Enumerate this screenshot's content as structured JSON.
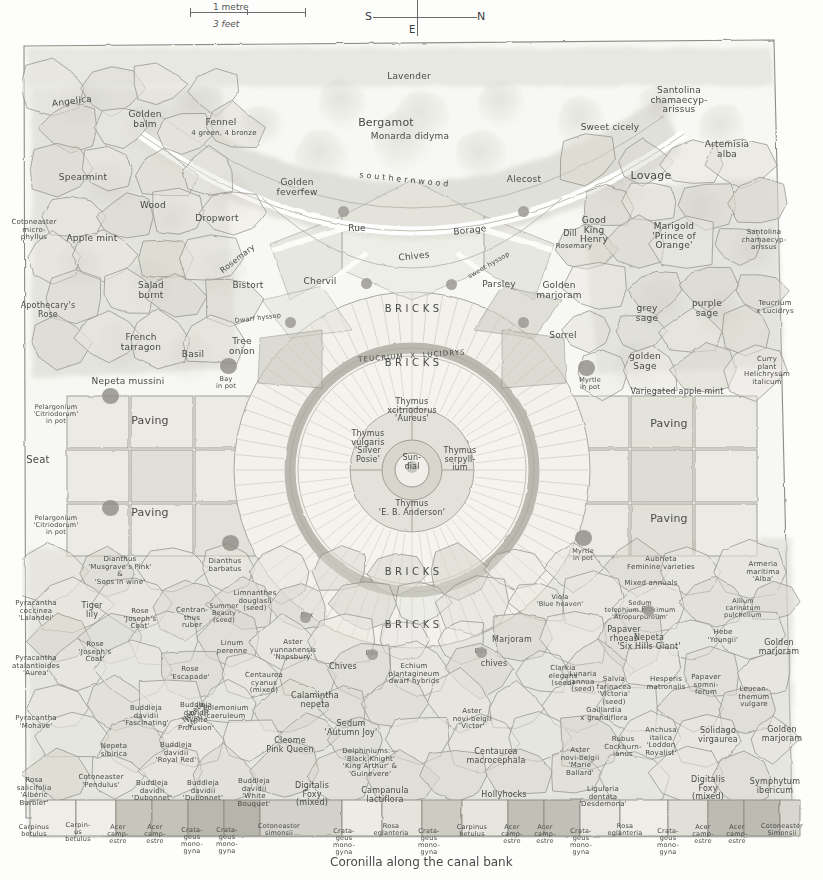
{
  "topbar": {
    "scale_upper": "1 metre",
    "scale_lower": "3 feet",
    "compass_s": "S",
    "compass_n": "N",
    "compass_e": "E"
  },
  "caption": "Coronilla along the canal bank",
  "brick_labels": {
    "top": "B R I C K S",
    "upper_mid": "B R I C K S",
    "lower_mid": "B R I C K S",
    "bottom": "B R I C K S",
    "teucrium_ring": "TEUCRIUM  X  LUCIDRYS"
  },
  "centre": {
    "sundial": "Sun-\ndial",
    "north_bed": "Thymus\nxcitriodorus\n'Aureus'",
    "west_bed": "Thymus\nvulgaris\n'Silver\nPosie'",
    "east_bed": "Thymus\nserpyll-\nium",
    "south_bed": "Thymus\n'E. B. Anderson'"
  },
  "paving": {
    "west_upper": "Paving",
    "west_lower": "Paving",
    "east_upper": "Paving",
    "east_lower": "Paving",
    "seat": "Seat"
  },
  "herb_beds": [
    {
      "name": "Lavender",
      "x": 409,
      "y": 72,
      "w": 120,
      "rot": 0
    },
    {
      "name": "Angelica",
      "x": 72,
      "y": 97,
      "w": 70,
      "rot": -7
    },
    {
      "name": "Golden\nbalm",
      "x": 145,
      "y": 110,
      "w": 58,
      "rot": 0
    },
    {
      "name": "Fennel",
      "x": 221,
      "y": 118,
      "w": 60,
      "rot": 0
    },
    {
      "name": "4 green, 4 bronze",
      "x": 224,
      "y": 130,
      "w": 90,
      "rot": 0,
      "size": "s7"
    },
    {
      "name": "Bergamot",
      "x": 386,
      "y": 117,
      "w": 80,
      "rot": 0,
      "size": "s11"
    },
    {
      "name": "Monarda didyma",
      "x": 410,
      "y": 132,
      "w": 110,
      "rot": 0
    },
    {
      "name": "Sweet cicely",
      "x": 610,
      "y": 123,
      "w": 90,
      "rot": 0
    },
    {
      "name": "Santolina\nchamaecyp-\narissus",
      "x": 679,
      "y": 86,
      "w": 80,
      "rot": 0
    },
    {
      "name": "Artemisia\nalba",
      "x": 727,
      "y": 140,
      "w": 70,
      "rot": 0
    },
    {
      "name": "Spearmint",
      "x": 83,
      "y": 173,
      "w": 80,
      "rot": 0
    },
    {
      "name": "Golden\nfeverfew",
      "x": 297,
      "y": 178,
      "w": 70,
      "rot": 0
    },
    {
      "name": "s o u t h e r n w o o d",
      "x": 404,
      "y": 176,
      "w": 130,
      "rot": 6,
      "size": "s8"
    },
    {
      "name": "Alecost",
      "x": 524,
      "y": 175,
      "w": 60,
      "rot": 0
    },
    {
      "name": "Lovage",
      "x": 651,
      "y": 170,
      "w": 60,
      "rot": 0,
      "size": "s11"
    },
    {
      "name": "Wood",
      "x": 153,
      "y": 201,
      "w": 50,
      "rot": 0
    },
    {
      "name": "Dropwort",
      "x": 217,
      "y": 214,
      "w": 70,
      "rot": 0
    },
    {
      "name": "Rue",
      "x": 357,
      "y": 224,
      "w": 40,
      "rot": 0
    },
    {
      "name": "Borage",
      "x": 470,
      "y": 226,
      "w": 60,
      "rot": -6
    },
    {
      "name": "Good\nKing\nHenry",
      "x": 594,
      "y": 216,
      "w": 48,
      "rot": 0
    },
    {
      "name": "Marigold\n'Prince of\nOrange'",
      "x": 674,
      "y": 222,
      "w": 70,
      "rot": 0
    },
    {
      "name": "Santolina\nchamaecyp-\narissus",
      "x": 764,
      "y": 229,
      "w": 72,
      "rot": 0,
      "size": "s7"
    },
    {
      "name": "Cotoneaster\nmicro-\nphyllus",
      "x": 34,
      "y": 219,
      "w": 62,
      "rot": 0,
      "size": "s7"
    },
    {
      "name": "Apple mint",
      "x": 92,
      "y": 234,
      "w": 76,
      "rot": 0
    },
    {
      "name": "Dill",
      "x": 570,
      "y": 230,
      "w": 30,
      "rot": 0,
      "size": "s8"
    },
    {
      "name": "Rosemary",
      "x": 574,
      "y": 243,
      "w": 54,
      "rot": 0,
      "size": "s7"
    },
    {
      "name": "Chives",
      "x": 414,
      "y": 252,
      "w": 50,
      "rot": -6
    },
    {
      "name": "Rosemary",
      "x": 238,
      "y": 255,
      "w": 56,
      "rot": -38,
      "size": "s8"
    },
    {
      "name": "Salad\nburnt",
      "x": 151,
      "y": 281,
      "w": 54,
      "rot": 0
    },
    {
      "name": "Bistort",
      "x": 248,
      "y": 281,
      "w": 50,
      "rot": 0
    },
    {
      "name": "Chervil",
      "x": 320,
      "y": 277,
      "w": 52,
      "rot": 0
    },
    {
      "name": "sweet hyssop",
      "x": 489,
      "y": 262,
      "w": 62,
      "rot": -30,
      "size": "s65"
    },
    {
      "name": "Parsley",
      "x": 499,
      "y": 280,
      "w": 52,
      "rot": 0
    },
    {
      "name": "Golden\nmarjoram",
      "x": 559,
      "y": 281,
      "w": 62,
      "rot": 0
    },
    {
      "name": "grey\nsage",
      "x": 647,
      "y": 304,
      "w": 40,
      "rot": 0
    },
    {
      "name": "purple\nsage",
      "x": 707,
      "y": 299,
      "w": 44,
      "rot": 0
    },
    {
      "name": "Teucrium\nx Lucidrys",
      "x": 775,
      "y": 300,
      "w": 60,
      "rot": 0,
      "size": "s7"
    },
    {
      "name": "Apothecary's\nRose",
      "x": 48,
      "y": 302,
      "w": 66,
      "rot": 0,
      "size": "s8"
    },
    {
      "name": "Dwarf hyssop",
      "x": 258,
      "y": 315,
      "w": 66,
      "rot": -7,
      "size": "s65"
    },
    {
      "name": "Tree\nonion",
      "x": 242,
      "y": 337,
      "w": 44,
      "rot": 0
    },
    {
      "name": "French\ntarragon",
      "x": 141,
      "y": 333,
      "w": 56,
      "rot": 0
    },
    {
      "name": "Basil",
      "x": 193,
      "y": 350,
      "w": 40,
      "rot": 0
    },
    {
      "name": "Sorrel",
      "x": 563,
      "y": 331,
      "w": 46,
      "rot": 0
    },
    {
      "name": "golden\nSage",
      "x": 645,
      "y": 352,
      "w": 48,
      "rot": 0
    },
    {
      "name": "Curry\nplant\nHelichrysum\nitalicum",
      "x": 767,
      "y": 356,
      "w": 66,
      "rot": 0,
      "size": "s7"
    },
    {
      "name": "Nepeta mussini",
      "x": 128,
      "y": 377,
      "w": 90,
      "rot": 0
    },
    {
      "name": "Bay\nin pot",
      "x": 226,
      "y": 376,
      "w": 32,
      "rot": 0,
      "size": "s65"
    },
    {
      "name": "Myrtle\nin pot",
      "x": 590,
      "y": 377,
      "w": 34,
      "rot": 0,
      "size": "s65"
    },
    {
      "name": "Variegated apple mint",
      "x": 677,
      "y": 388,
      "w": 120,
      "rot": 0,
      "size": "s8"
    },
    {
      "name": "Pelargonium\n'Citriodorum'\nin pot",
      "x": 56,
      "y": 404,
      "w": 66,
      "rot": 0,
      "size": "s65"
    },
    {
      "name": "Pelargonium\n'Citriodorum'\nin pot",
      "x": 56,
      "y": 515,
      "w": 66,
      "rot": 0,
      "size": "s65"
    },
    {
      "name": "Dianthus\n'Musgrave's Pink'\n&\n'Sops in wine'",
      "x": 120,
      "y": 556,
      "w": 110,
      "rot": 0,
      "size": "s7"
    },
    {
      "name": "Dianthus\nbarbatus",
      "x": 225,
      "y": 558,
      "w": 50,
      "rot": 0,
      "size": "s7"
    },
    {
      "name": "Myrtle\nin pot",
      "x": 583,
      "y": 548,
      "w": 34,
      "rot": 0,
      "size": "s65"
    }
  ],
  "lower_beds": [
    {
      "name": "Limnanthes\ndouglasii\n(seed)",
      "x": 255,
      "y": 590,
      "w": 66,
      "rot": 0,
      "size": "s7"
    },
    {
      "name": "Box",
      "x": 307,
      "y": 612,
      "w": 24,
      "rot": 0,
      "size": "s65"
    },
    {
      "name": "Pyracantha\ncoccinea\n'Lalandei'",
      "x": 36,
      "y": 600,
      "w": 62,
      "rot": 0,
      "size": "s7"
    },
    {
      "name": "Tiger\nlily",
      "x": 92,
      "y": 602,
      "w": 40,
      "rot": 0,
      "size": "s8"
    },
    {
      "name": "Rose\n'Joseph's\nCoat'",
      "x": 140,
      "y": 608,
      "w": 50,
      "rot": 0,
      "size": "s7"
    },
    {
      "name": "Centran-\nthus\nruber",
      "x": 192,
      "y": 607,
      "w": 52,
      "rot": 0,
      "size": "s7"
    },
    {
      "name": "Summer\nBeauty\n(seed)",
      "x": 224,
      "y": 603,
      "w": 46,
      "rot": 0,
      "size": "s65"
    },
    {
      "name": "Rose\n'Joseph's\nCoat'",
      "x": 95,
      "y": 641,
      "w": 48,
      "rot": 0,
      "size": "s7"
    },
    {
      "name": "Linum\nperenne",
      "x": 232,
      "y": 640,
      "w": 46,
      "rot": 0,
      "size": "s7"
    },
    {
      "name": "Aster\nyunnanensis\n'Napsbury'",
      "x": 293,
      "y": 639,
      "w": 60,
      "rot": 0,
      "size": "s7"
    },
    {
      "name": "Chives",
      "x": 343,
      "y": 663,
      "w": 44,
      "rot": 0,
      "size": "s8"
    },
    {
      "name": "Box",
      "x": 372,
      "y": 650,
      "w": 22,
      "rot": 0,
      "size": "s65"
    },
    {
      "name": "Echium\nplantagineum\ndwarf hybrids",
      "x": 414,
      "y": 663,
      "w": 72,
      "rot": 0,
      "size": "s7"
    },
    {
      "name": "Box",
      "x": 481,
      "y": 648,
      "w": 22,
      "rot": 0,
      "size": "s65"
    },
    {
      "name": "chives",
      "x": 494,
      "y": 660,
      "w": 40,
      "rot": 0,
      "size": "s8"
    },
    {
      "name": "Marjoram",
      "x": 512,
      "y": 636,
      "w": 58,
      "rot": 0,
      "size": "s8"
    },
    {
      "name": "Clarkia\nelegans\n(seed)",
      "x": 563,
      "y": 665,
      "w": 50,
      "rot": 0,
      "size": "s7"
    },
    {
      "name": "Box",
      "x": 648,
      "y": 606,
      "w": 22,
      "rot": 0,
      "size": "s65"
    },
    {
      "name": "Papaver\nrhoeas",
      "x": 624,
      "y": 626,
      "w": 48,
      "rot": 0,
      "size": "s8"
    },
    {
      "name": "Viola\n'Blue heaven'",
      "x": 560,
      "y": 594,
      "w": 48,
      "rot": 0,
      "size": "s65"
    },
    {
      "name": "Aubrieta\nFeminine varieties",
      "x": 661,
      "y": 556,
      "w": 90,
      "rot": 0,
      "size": "s7"
    },
    {
      "name": "Mixed annuals",
      "x": 651,
      "y": 580,
      "w": 80,
      "rot": 0,
      "size": "s7"
    },
    {
      "name": "Armeria\nmaritima\n'Alba'",
      "x": 763,
      "y": 561,
      "w": 52,
      "rot": 0,
      "size": "s7"
    },
    {
      "name": "Sedum\ntelephium maximum\n'Atropurpureum'",
      "x": 640,
      "y": 600,
      "w": 110,
      "rot": 0,
      "size": "s65"
    },
    {
      "name": "Allium\ncarinatum\npulchellum",
      "x": 743,
      "y": 598,
      "w": 56,
      "rot": 0,
      "size": "s65"
    },
    {
      "name": "Nepeta\n'Six Hills Giant'",
      "x": 649,
      "y": 634,
      "w": 88,
      "rot": 0,
      "size": "s8"
    },
    {
      "name": "Hebe\n'Youngii'",
      "x": 723,
      "y": 629,
      "w": 46,
      "rot": 0,
      "size": "s7"
    },
    {
      "name": "Golden\nmarjoram",
      "x": 779,
      "y": 639,
      "w": 52,
      "rot": 0,
      "size": "s8"
    },
    {
      "name": "Centaurea\ncyanus\n(mixed)",
      "x": 264,
      "y": 672,
      "w": 52,
      "rot": 0,
      "size": "s7"
    },
    {
      "name": "Calamintha\nnepeta",
      "x": 315,
      "y": 692,
      "w": 58,
      "rot": 0,
      "size": "s8"
    },
    {
      "name": "Polemonium\ncaeruleum",
      "x": 226,
      "y": 705,
      "w": 62,
      "rot": 0,
      "size": "s7"
    },
    {
      "name": "Rose\n'Escapade'",
      "x": 190,
      "y": 666,
      "w": 52,
      "rot": 0,
      "size": "s7"
    },
    {
      "name": "Nepeta\nsibirica",
      "x": 196,
      "y": 708,
      "w": 46,
      "rot": -42,
      "size": "s7"
    },
    {
      "name": "Sedum\n'Autumn Joy'",
      "x": 351,
      "y": 720,
      "w": 64,
      "rot": 0,
      "size": "s8"
    },
    {
      "name": "Aster\nnovi-belgii\n'Victor'",
      "x": 472,
      "y": 708,
      "w": 54,
      "rot": 0,
      "size": "s7"
    },
    {
      "name": "Salvia\nfarinacea\n'Victoria'\n(seed)",
      "x": 614,
      "y": 676,
      "w": 54,
      "rot": 0,
      "size": "s7"
    },
    {
      "name": "Hesperis\nmatronalis",
      "x": 666,
      "y": 676,
      "w": 52,
      "rot": 0,
      "size": "s7"
    },
    {
      "name": "Papaver\nsomni-\nferum",
      "x": 706,
      "y": 674,
      "w": 44,
      "rot": 0,
      "size": "s7"
    },
    {
      "name": "Leucan-\nthemum\nvulgare",
      "x": 754,
      "y": 686,
      "w": 44,
      "rot": 0,
      "size": "s7"
    },
    {
      "name": "Lunaria\nannua\n(seed)",
      "x": 583,
      "y": 671,
      "w": 42,
      "rot": 0,
      "size": "s7"
    },
    {
      "name": "Gaillardia\nx grandiflora",
      "x": 604,
      "y": 707,
      "w": 60,
      "rot": 0,
      "size": "s7"
    },
    {
      "name": "Delphiniums:—\n'Black Knight'\n'King Arthur' &\n'Guinevere'",
      "x": 370,
      "y": 748,
      "w": 96,
      "rot": 0,
      "size": "s7"
    },
    {
      "name": "Centaurea\nmacrocephala",
      "x": 496,
      "y": 748,
      "w": 70,
      "rot": 0,
      "size": "s8"
    },
    {
      "name": "Aster\nnovi-belgii\n'Marie\nBallard'",
      "x": 580,
      "y": 747,
      "w": 46,
      "rot": 0,
      "size": "s7"
    },
    {
      "name": "Anchusa\nitalica\n'Loddon\nRoyalist'",
      "x": 661,
      "y": 727,
      "w": 46,
      "rot": 0,
      "size": "s7"
    },
    {
      "name": "Solidago\nvirgaurea",
      "x": 718,
      "y": 727,
      "w": 56,
      "rot": 0,
      "size": "s8"
    },
    {
      "name": "Golden\nmarjoram",
      "x": 782,
      "y": 726,
      "w": 52,
      "rot": 0,
      "size": "s8"
    },
    {
      "name": "Rubus\nCockburn-\nianus",
      "x": 623,
      "y": 736,
      "w": 46,
      "rot": 0,
      "size": "s7"
    },
    {
      "name": "Ligularia\ndentata\n'Desdemona'",
      "x": 603,
      "y": 786,
      "w": 60,
      "rot": 0,
      "size": "s7"
    },
    {
      "name": "Digitalis\nFoxy\n(mixed)",
      "x": 708,
      "y": 776,
      "w": 46,
      "rot": 0,
      "size": "s8"
    },
    {
      "name": "Symphytum\nibericum",
      "x": 775,
      "y": 778,
      "w": 58,
      "rot": 0,
      "size": "s8"
    },
    {
      "name": "Hollyhocks",
      "x": 504,
      "y": 791,
      "w": 66,
      "rot": 0,
      "size": "s8"
    },
    {
      "name": "Campanula\nlactiflora",
      "x": 385,
      "y": 787,
      "w": 58,
      "rot": 0,
      "size": "s8"
    },
    {
      "name": "Digitalis\nFoxy\n(mixed)",
      "x": 312,
      "y": 782,
      "w": 42,
      "rot": 0,
      "size": "s8"
    },
    {
      "name": "Cleome\nPink Queen",
      "x": 290,
      "y": 737,
      "w": 56,
      "rot": 0,
      "size": "s8"
    },
    {
      "name": "Pyracantha\natalantioides\n'Aurea'",
      "x": 36,
      "y": 655,
      "w": 62,
      "rot": 0,
      "size": "s7"
    },
    {
      "name": "Pyracantha\n'Mohave'",
      "x": 36,
      "y": 715,
      "w": 58,
      "rot": 0,
      "size": "s7"
    },
    {
      "name": "Buddleja\ndavidii\n'Fascinating'",
      "x": 146,
      "y": 705,
      "w": 52,
      "rot": 0,
      "size": "s7"
    },
    {
      "name": "Buddleja\ndavidii\n'White\nProfusion'",
      "x": 196,
      "y": 702,
      "w": 46,
      "rot": 0,
      "size": "s7"
    },
    {
      "name": "Buddleja\ndavidii\n'Royal Red'",
      "x": 176,
      "y": 742,
      "w": 46,
      "rot": 0,
      "size": "s7"
    },
    {
      "name": "Nepeta\nsibirica",
      "x": 114,
      "y": 743,
      "w": 44,
      "rot": 0,
      "size": "s7"
    },
    {
      "name": "Rosa\nsalicifolia\n'Albéric\nBarbier'",
      "x": 34,
      "y": 777,
      "w": 46,
      "rot": 0,
      "size": "s7"
    },
    {
      "name": "Cotoneaster\n'Pendulus'",
      "x": 101,
      "y": 774,
      "w": 56,
      "rot": 0,
      "size": "s7"
    },
    {
      "name": "Buddleja\ndavidii\n'Dubonnet'",
      "x": 152,
      "y": 780,
      "w": 44,
      "rot": 0,
      "size": "s7"
    },
    {
      "name": "Buddleja\ndavidii\n'Dubonnet'",
      "x": 203,
      "y": 780,
      "w": 44,
      "rot": 0,
      "size": "s7"
    },
    {
      "name": "Buddleja\ndavidii\n'White\nBouquet'",
      "x": 254,
      "y": 778,
      "w": 46,
      "rot": 0,
      "size": "s7"
    }
  ],
  "tree_row": [
    {
      "name": "Carpinus\nbetulus",
      "x": 34,
      "y": 824
    },
    {
      "name": "Carpin-\nus\nbetulus",
      "x": 78,
      "y": 822
    },
    {
      "name": "Acer\ncamp-\nestre",
      "x": 118,
      "y": 824
    },
    {
      "name": "Acer\ncamp-\nestre",
      "x": 155,
      "y": 824
    },
    {
      "name": "Crata-\ngeus\nmono-\ngyna",
      "x": 192,
      "y": 827
    },
    {
      "name": "Crata-\ngeus\nmono-\ngyna",
      "x": 227,
      "y": 827
    },
    {
      "name": "Cotoneaster\nsimonsii",
      "x": 279,
      "y": 823
    },
    {
      "name": "Crata-\ngeus\nmono-\ngyna",
      "x": 344,
      "y": 828
    },
    {
      "name": "Rosa\neglanteria",
      "x": 391,
      "y": 823
    },
    {
      "name": "Crata-\ngeus\nmono-\ngyna",
      "x": 429,
      "y": 828
    },
    {
      "name": "Carpinus\nbetulus",
      "x": 472,
      "y": 824
    },
    {
      "name": "Acer\ncamp-\nestre",
      "x": 512,
      "y": 824
    },
    {
      "name": "Acer\ncamp-\nestre",
      "x": 545,
      "y": 824
    },
    {
      "name": "Crata-\ngeus\nmono-\ngyna",
      "x": 581,
      "y": 828
    },
    {
      "name": "Rosa\neglanteria",
      "x": 625,
      "y": 823
    },
    {
      "name": "Crata-\ngeus\nmono-\ngyna",
      "x": 668,
      "y": 828
    },
    {
      "name": "Acer\ncamp-\nestre",
      "x": 703,
      "y": 824
    },
    {
      "name": "Acer\ncamp-\nestre",
      "x": 737,
      "y": 824
    },
    {
      "name": "Cotoneaster\nSimonsii",
      "x": 782,
      "y": 823
    }
  ],
  "box_markers": [
    {
      "x": 366,
      "y": 283
    },
    {
      "x": 451,
      "y": 284
    },
    {
      "x": 290,
      "y": 322
    },
    {
      "x": 523,
      "y": 322
    },
    {
      "x": 343,
      "y": 211
    },
    {
      "x": 523,
      "y": 211
    },
    {
      "x": 305,
      "y": 617
    },
    {
      "x": 372,
      "y": 654
    },
    {
      "x": 481,
      "y": 652
    },
    {
      "x": 648,
      "y": 610
    }
  ],
  "pots": [
    {
      "x": 228,
      "y": 366
    },
    {
      "x": 586,
      "y": 368
    },
    {
      "x": 230,
      "y": 543
    },
    {
      "x": 583,
      "y": 538
    },
    {
      "x": 110,
      "y": 396
    },
    {
      "x": 110,
      "y": 508
    }
  ],
  "colors": {
    "ink": "#4a4a4a",
    "wash_light": "#e9e9e4",
    "wash_mid": "#d2d2ca",
    "wash_dark": "#b3b2a8",
    "brick_ring": "#b8b7ac",
    "paper": "#fdfdfb"
  }
}
